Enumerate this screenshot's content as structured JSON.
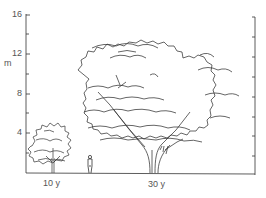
{
  "diagram": {
    "type": "tree-growth-comparison",
    "axis": {
      "unit": "m",
      "ticks": [
        {
          "value": "16",
          "y": 15
        },
        {
          "value": "12",
          "y": 54
        },
        {
          "value": "8",
          "y": 94
        },
        {
          "value": "4",
          "y": 133
        }
      ],
      "minor_tick_step_m": 2
    },
    "trees": [
      {
        "label": "10 y",
        "height_m": 6
      },
      {
        "label": "30 y",
        "height_m": 16
      }
    ],
    "figure": {
      "label": "person",
      "height_m": 1.8
    },
    "colors": {
      "line": "#333333",
      "label": "#555555",
      "background": "#ffffff"
    }
  }
}
